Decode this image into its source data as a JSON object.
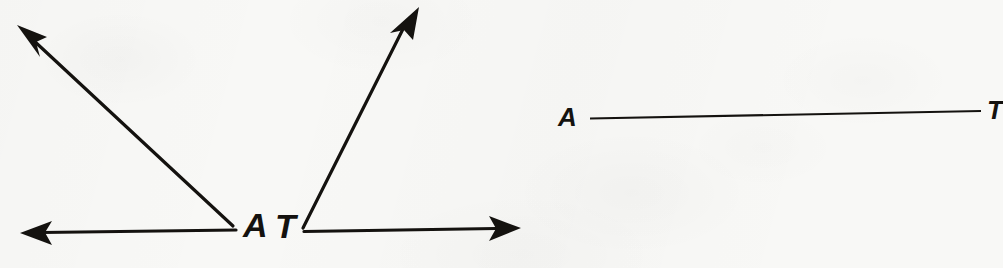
{
  "figure": {
    "background_color": "#f8f8f6",
    "ink_color": "#14120f",
    "panels": [
      {
        "name": "angle-a",
        "type": "angle",
        "vertex_label": "A",
        "vertex": [
          237,
          229
        ],
        "rays": [
          {
            "name": "ray-upper-left",
            "to": [
              18,
              26
            ],
            "arrowhead": true
          },
          {
            "name": "ray-left-horizontal",
            "to": [
              22,
              233
            ],
            "arrowhead": true
          }
        ],
        "label_position": [
          244,
          208
        ],
        "stroke_width": 3
      },
      {
        "name": "angle-t",
        "type": "angle",
        "vertex_label": "T",
        "vertex": [
          302,
          231
        ],
        "rays": [
          {
            "name": "ray-upper-right",
            "to": [
              418,
              8
            ],
            "arrowhead": true
          },
          {
            "name": "ray-right-horizontal",
            "to": [
              520,
              228
            ],
            "arrowhead": true
          }
        ],
        "label_position": [
          275,
          210
        ],
        "stroke_width": 3
      },
      {
        "name": "segment-at",
        "type": "segment",
        "endpoint_labels": [
          "A",
          "T"
        ],
        "from": [
          590,
          118
        ],
        "to": [
          981,
          111
        ],
        "label_positions": [
          [
            557,
            103
          ],
          [
            985,
            96
          ]
        ],
        "stroke_width": 2
      }
    ]
  },
  "labels": {
    "angle_a_vertex": "A",
    "angle_t_vertex": "T",
    "segment_start": "A",
    "segment_end": "T"
  }
}
